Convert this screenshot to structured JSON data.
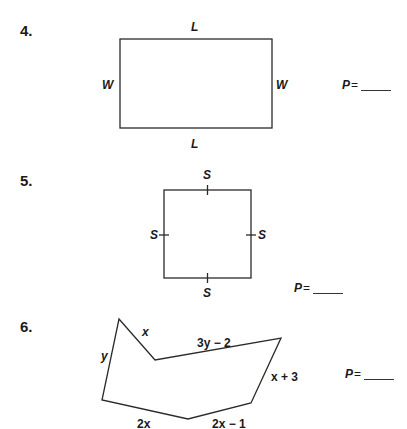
{
  "problems": [
    {
      "number": "4.",
      "shape": "rectangle",
      "side_labels": {
        "top": "L",
        "bottom": "L",
        "left": "W",
        "right": "W"
      },
      "perimeter_label": "P",
      "equals": "=",
      "answer": ""
    },
    {
      "number": "5.",
      "shape": "square",
      "side_labels": {
        "top": "S",
        "bottom": "S",
        "left": "S",
        "right": "S"
      },
      "perimeter_label": "P",
      "equals": "=",
      "answer": ""
    },
    {
      "number": "6.",
      "shape": "hexagon",
      "side_labels": {
        "left": "y",
        "upper_left": "x",
        "top": "3y − 2",
        "right": "x + 3",
        "bottom_right": "2x − 1",
        "bottom_left": "2x"
      },
      "perimeter_label": "P",
      "equals": "=",
      "answer": ""
    }
  ],
  "colors": {
    "stroke": "#2a2a2a",
    "text": "#1a1a1a",
    "background": "#ffffff"
  }
}
